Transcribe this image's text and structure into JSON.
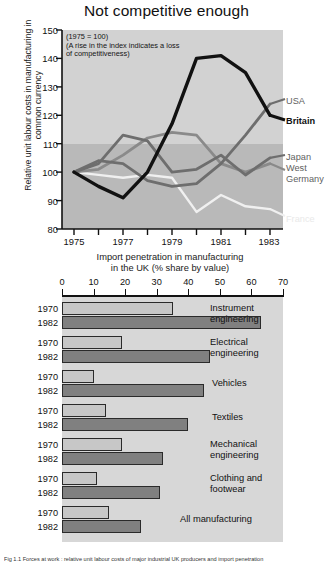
{
  "line_chart_title": "Not competitive enough",
  "line_ylabel": "Relative unit labour costs in manufacturing in common currency",
  "line_note": "(1975 = 100)\n(A rise in the index indicates a loss\nof competitiveness)",
  "bar_title": "Import penetration in manufacturing\nin the UK (% share by value)",
  "caption": "Fig 1.1  Forces at work : relative unit labour costs of major industrial UK producers and import penetration",
  "colors": {
    "plot_bg": "#d2d2d2",
    "band_low": "#b9b9b9",
    "britain": "#111111",
    "usa": "#6e6e6e",
    "japan": "#6e6e6e",
    "west_germany": "#8a8a8a",
    "france": "#f0f0f0",
    "bar_1970": "#c7c7c7",
    "bar_1982": "#808080"
  },
  "chart_data": [
    {
      "type": "line",
      "title": "Not competitive enough",
      "xlabel": "",
      "ylabel": "Relative unit labour costs in manufacturing in common currency",
      "annotation": "(1975 = 100) (A rise in the index indicates a loss of competitiveness)",
      "xlim": [
        1974,
        1983
      ],
      "ylim": [
        80,
        150
      ],
      "yticks": [
        80,
        90,
        100,
        110,
        120,
        130,
        140,
        150
      ],
      "xticks": [
        1975,
        1977,
        1979,
        1981,
        1983
      ],
      "grid": false,
      "legend_position": "right",
      "x": [
        1975,
        1976,
        1977,
        1978,
        1979,
        1980,
        1981,
        1982,
        1983
      ],
      "series": [
        {
          "name": "Britain",
          "values": [
            100,
            95,
            91,
            100,
            117,
            140,
            141,
            135,
            120
          ]
        },
        {
          "name": "USA",
          "values": [
            100,
            104,
            103,
            97,
            95,
            96,
            103,
            113,
            124
          ]
        },
        {
          "name": "Japan",
          "values": [
            100,
            103,
            113,
            111,
            100,
            101,
            106,
            99,
            105
          ]
        },
        {
          "name": "West Germany",
          "values": [
            100,
            101,
            106,
            112,
            114,
            113,
            103,
            100,
            103
          ]
        },
        {
          "name": "France",
          "values": [
            100,
            99,
            98,
            99,
            98,
            86,
            92,
            88,
            87
          ]
        }
      ]
    },
    {
      "type": "bar",
      "orientation": "horizontal",
      "title": "Import penetration in manufacturing in the UK (% share by value)",
      "xlabel": "% share by value",
      "xlim": [
        0,
        70
      ],
      "xticks": [
        0,
        10,
        20,
        30,
        40,
        50,
        60,
        70
      ],
      "categories": [
        "Instrument engineering",
        "Electrical engineering",
        "Vehicles",
        "Textiles",
        "Mechanical engineering",
        "Clothing and footwear",
        "All manufacturing"
      ],
      "series": [
        {
          "name": "1970",
          "values": [
            35,
            19,
            10,
            14,
            19,
            11,
            15
          ]
        },
        {
          "name": "1982",
          "values": [
            63,
            47,
            45,
            40,
            32,
            31,
            25
          ]
        }
      ]
    }
  ],
  "yticks_labels": [
    "150",
    "140",
    "130",
    "120",
    "110",
    "100",
    "90",
    "80"
  ],
  "xticks_labels": [
    "1975",
    "1977",
    "1979",
    "1981",
    "1983"
  ],
  "bar_xticks_labels": [
    "0",
    "10",
    "20",
    "30",
    "40",
    "50",
    "60",
    "70"
  ],
  "series_labels": {
    "usa": "USA",
    "britain": "Britain",
    "japan": "Japan",
    "west": "West",
    "germany": "Germany",
    "france": "France"
  },
  "bar_groups": [
    {
      "category_line1": "Instrument",
      "category_line2": "engineering",
      "y1970_label": "1970",
      "y1982_label": "1982",
      "v1970": 35,
      "v1982": 63
    },
    {
      "category_line1": "Electrical",
      "category_line2": "engineering",
      "y1970_label": "1970",
      "y1982_label": "1982",
      "v1970": 19,
      "v1982": 47
    },
    {
      "category_line1": "Vehicles",
      "category_line2": "",
      "y1970_label": "1970",
      "y1982_label": "1982",
      "v1970": 10,
      "v1982": 45
    },
    {
      "category_line1": "Textiles",
      "category_line2": "",
      "y1970_label": "1970",
      "y1982_label": "1982",
      "v1970": 14,
      "v1982": 40
    },
    {
      "category_line1": "Mechanical",
      "category_line2": "engineering",
      "y1970_label": "1970",
      "y1982_label": "1982",
      "v1970": 19,
      "v1982": 32
    },
    {
      "category_line1": "Clothing and",
      "category_line2": "footwear",
      "y1970_label": "1970",
      "y1982_label": "1982",
      "v1970": 11,
      "v1982": 31
    },
    {
      "category_line1": "All manufacturing",
      "category_line2": "",
      "y1970_label": "1970",
      "y1982_label": "1982",
      "v1970": 15,
      "v1982": 25
    }
  ]
}
